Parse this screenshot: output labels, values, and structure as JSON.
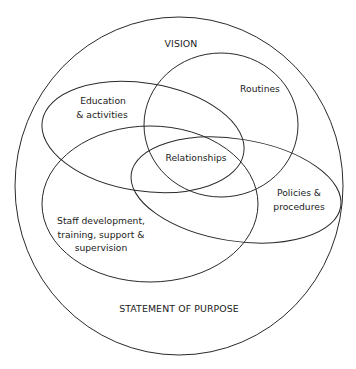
{
  "diagram": {
    "outer": {
      "label": "Vision and Statement of Purpose boundary",
      "top_label": "VISION",
      "bottom_label": "STATEMENT OF PURPOSE"
    },
    "sets": [
      {
        "id": "routines",
        "lines": [
          "Routines"
        ]
      },
      {
        "id": "education",
        "lines": [
          "Education",
          "& activities"
        ]
      },
      {
        "id": "staff",
        "lines": [
          "Staff development,",
          "training, support &",
          "supervision"
        ]
      },
      {
        "id": "policies",
        "lines": [
          "Policies &",
          "procedures"
        ]
      }
    ],
    "center": {
      "label": "Relationships"
    },
    "colors": {
      "stroke": "#2a2a2a",
      "text": "#222222",
      "background": "#ffffff"
    }
  }
}
